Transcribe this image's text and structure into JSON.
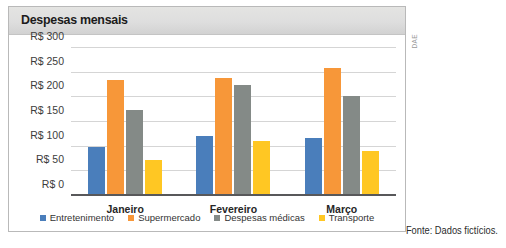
{
  "chart_data": {
    "type": "bar",
    "title": "Despesas mensais",
    "xlabel": "",
    "ylabel": "",
    "categories": [
      "Janeiro",
      "Fevereiro",
      "Março"
    ],
    "series": [
      {
        "name": "Entretenimento",
        "color": "#4a7ebb",
        "values": [
          100,
          122,
          118
        ]
      },
      {
        "name": "Supermercado",
        "color": "#f79739",
        "values": [
          235,
          240,
          260
        ]
      },
      {
        "name": "Despesas médicas",
        "color": "#848a87",
        "values": [
          175,
          225,
          202
        ]
      },
      {
        "name": "Transporte",
        "color": "#ffc723",
        "values": [
          72,
          112,
          92
        ]
      }
    ],
    "ylim": [
      0,
      300
    ],
    "ytick_values": [
      0,
      50,
      100,
      150,
      200,
      250,
      300
    ],
    "ytick_labels": [
      "R$ 0",
      "R$ 50",
      "R$ 100",
      "R$ 150",
      "R$ 200",
      "R$ 250",
      "R$ 300"
    ],
    "grid": true,
    "legend_position": "bottom",
    "currency_prefix": "R$"
  },
  "annotations": {
    "source_note": "Fonte: Dados fictícios.",
    "watermark": "DAE"
  }
}
